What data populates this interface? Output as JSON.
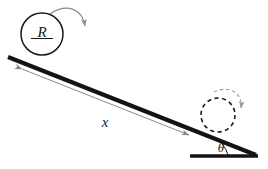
{
  "figure": {
    "background_color": "#ffffff",
    "width": 268,
    "height": 169
  },
  "colors": {
    "incline_stroke": "#141414",
    "base_stroke": "#141414",
    "circle_stroke": "#1a1a1a",
    "dashed_circle_stroke": "#1a1a1a",
    "dimension_arrow": "#8a8a8a",
    "rotation_arrow": "#8a8a8a",
    "dashed_rotation_arrow": "#9a9a9a",
    "angle_arc": "#1a1a1a",
    "label_text": "#1a1a1a"
  },
  "labels": {
    "radius": "R",
    "distance": "x",
    "angle": "θ"
  },
  "elements": {
    "wheel_start": {
      "name": "solid-wheel",
      "style": "solid",
      "center_x": 42,
      "center_y": 34,
      "radius": 21
    },
    "wheel_end": {
      "name": "dashed-wheel",
      "style": "dashed",
      "center_x": 218,
      "center_y": 115,
      "radius": 17
    },
    "incline": {
      "name": "inclined-plane",
      "x1": 8,
      "y1": 57,
      "x2": 256,
      "y2": 155
    },
    "ground": {
      "name": "horizontal-ground",
      "x1": 190,
      "y1": 156,
      "x2": 258,
      "y2": 156
    },
    "distance_arrow": {
      "name": "distance-dimension-arrow",
      "x1": 22,
      "y1": 69,
      "x2": 189,
      "y2": 135,
      "double_headed": true
    },
    "rotation_arrow_start": {
      "name": "clockwise-rotation-arrow-solid",
      "direction": "clockwise"
    },
    "rotation_arrow_end": {
      "name": "clockwise-rotation-arrow-dashed",
      "direction": "clockwise"
    },
    "angle_marker": {
      "name": "incline-angle-arc",
      "vertex_x": 256,
      "vertex_y": 155
    }
  }
}
